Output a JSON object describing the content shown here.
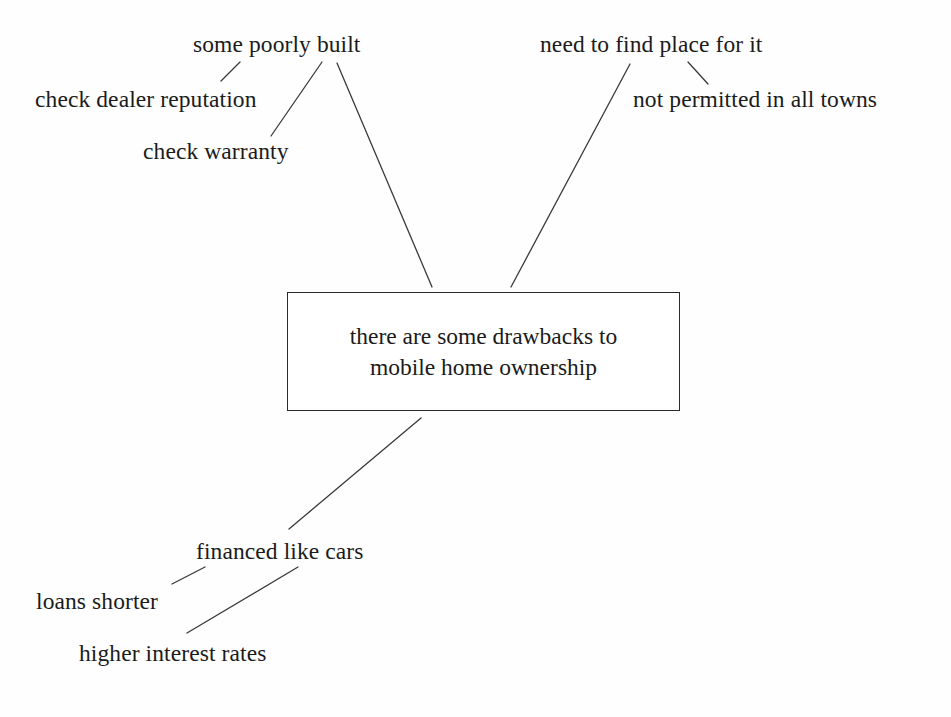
{
  "diagram": {
    "background_color": "#fefefe",
    "text_color": "#1b1b1b",
    "line_color": "#3a3a3a",
    "central_node": {
      "text": "there are some drawbacks to\nmobile home ownership",
      "x": 287,
      "y": 292,
      "width": 393,
      "height": 119,
      "border_color": "#2a2a2a",
      "fill_color": "#ffffff"
    },
    "nodes": [
      {
        "id": "some-poorly-built",
        "label": "some poorly built",
        "x": 193,
        "y": 31
      },
      {
        "id": "check-dealer-reputation",
        "label": "check dealer reputation",
        "x": 35,
        "y": 86
      },
      {
        "id": "check-warranty",
        "label": "check warranty",
        "x": 143,
        "y": 138
      },
      {
        "id": "need-to-find-place-for-it",
        "label": "need to find place for it",
        "x": 540,
        "y": 31
      },
      {
        "id": "not-permitted-in-all-towns",
        "label": "not permitted in all towns",
        "x": 633,
        "y": 86
      },
      {
        "id": "financed-like-cars",
        "label": "financed like cars",
        "x": 196,
        "y": 538
      },
      {
        "id": "loans-shorter",
        "label": "loans shorter",
        "x": 36,
        "y": 588
      },
      {
        "id": "higher-interest-rates",
        "label": "higher interest rates",
        "x": 79,
        "y": 640
      }
    ],
    "edges": [
      {
        "id": "edge-poorly-built-to-center",
        "from": "some-poorly-built",
        "to": "central-node",
        "x1": 337,
        "y1": 63,
        "x2": 432,
        "y2": 287
      },
      {
        "id": "edge-dealer-reputation-to-poorly-built",
        "from": "check-dealer-reputation",
        "to": "some-poorly-built",
        "x1": 221,
        "y1": 81,
        "x2": 240,
        "y2": 62
      },
      {
        "id": "edge-warranty-to-poorly-built",
        "from": "check-warranty",
        "to": "some-poorly-built",
        "x1": 271,
        "y1": 136,
        "x2": 322,
        "y2": 62
      },
      {
        "id": "edge-find-place-to-center",
        "from": "need-to-find-place-for-it",
        "to": "central-node",
        "x1": 630,
        "y1": 64,
        "x2": 511,
        "y2": 287
      },
      {
        "id": "edge-not-permitted-to-find-place",
        "from": "not-permitted-in-all-towns",
        "to": "need-to-find-place-for-it",
        "x1": 688,
        "y1": 62,
        "x2": 708,
        "y2": 84
      },
      {
        "id": "edge-center-to-financed",
        "from": "central-node",
        "to": "financed-like-cars",
        "x1": 421,
        "y1": 418,
        "x2": 289,
        "y2": 529
      },
      {
        "id": "edge-loans-shorter-to-financed",
        "from": "loans-shorter",
        "to": "financed-like-cars",
        "x1": 172,
        "y1": 584,
        "x2": 205,
        "y2": 567
      },
      {
        "id": "edge-higher-rates-to-financed",
        "from": "higher-interest-rates",
        "to": "financed-like-cars",
        "x1": 187,
        "y1": 633,
        "x2": 298,
        "y2": 567
      }
    ]
  }
}
